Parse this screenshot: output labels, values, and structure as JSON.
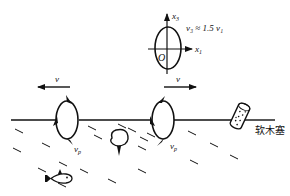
{
  "figure": {
    "type": "physics-diagram"
  },
  "inset": {
    "axis_x_label": "x",
    "axis_x_sub": "1",
    "axis_y_label": "x",
    "axis_y_sub": "3",
    "origin_label": "O",
    "relation": "v₃ ≈ 1.5 v₁"
  },
  "left_orbit": {
    "velocity_label": "v",
    "velocity_direction": "left",
    "particle_velocity_label": "v",
    "particle_velocity_sub": "p"
  },
  "right_orbit": {
    "velocity_label": "v",
    "velocity_direction": "right",
    "particle_velocity_label": "v",
    "particle_velocity_sub": "p"
  },
  "cork": {
    "label": "软木塞"
  },
  "colors": {
    "ink": "#111111",
    "background": "#ffffff"
  }
}
